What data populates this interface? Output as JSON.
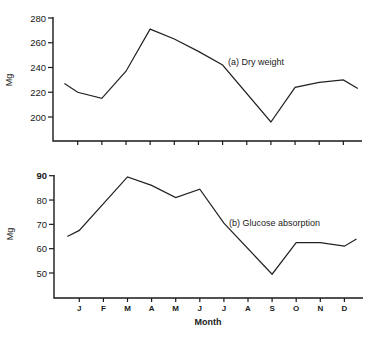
{
  "figure": {
    "background": "#ffffff",
    "ink_color": "#1a1a1a",
    "x_axis_title": "Month"
  },
  "chart_data": [
    {
      "type": "line",
      "title": "(a) Dry weight",
      "xlabel": "",
      "ylabel": "Mg",
      "ylim": [
        180,
        280
      ],
      "yticks": [
        200,
        220,
        240,
        260,
        280
      ],
      "grid": false,
      "categories": [
        "start",
        "J",
        "F",
        "M",
        "A",
        "M",
        "J",
        "J",
        "A",
        "S",
        "O",
        "N",
        "D",
        "end"
      ],
      "tick_labels_visible": false,
      "series": [
        {
          "name": "Dry weight",
          "x_index": [
            -0.55,
            0,
            1,
            2,
            3,
            4,
            5,
            6,
            8,
            9,
            10,
            11,
            11.6
          ],
          "values": [
            227,
            220,
            215,
            237,
            271,
            263,
            253,
            242,
            196,
            224,
            228,
            230,
            223
          ]
        }
      ],
      "annotations": [
        {
          "text": "(a) Dry weight",
          "near": "J-J decline"
        }
      ]
    },
    {
      "type": "line",
      "title": "(b) Glucose absorption",
      "xlabel": "Month",
      "ylabel": "Mg",
      "ylim": [
        40,
        90
      ],
      "yticks": [
        50,
        60,
        70,
        80,
        90
      ],
      "grid": false,
      "categories": [
        "J",
        "F",
        "M",
        "A",
        "M",
        "J",
        "J",
        "A",
        "S",
        "O",
        "N",
        "D"
      ],
      "series": [
        {
          "name": "Glucose absorption",
          "x_index": [
            -0.5,
            0,
            2,
            3,
            4,
            5,
            6,
            8,
            9,
            10,
            11,
            11.5
          ],
          "values": [
            65,
            67.5,
            89.5,
            86,
            81,
            84.5,
            70.5,
            49.5,
            62.5,
            62.5,
            61,
            64
          ]
        }
      ],
      "annotations": [
        {
          "text": "(b) Glucose absorption",
          "near": "J-A decline"
        }
      ]
    }
  ],
  "panels": [
    {
      "id": "a",
      "label": "(a) Dry weight",
      "ylabel": "Mg",
      "yticks": [
        "200",
        "220",
        "240",
        "260",
        "280"
      ]
    },
    {
      "id": "b",
      "label": "(b) Glucose absorption",
      "ylabel": "Mg",
      "yticks": [
        "50",
        "60",
        "70",
        "80",
        "90"
      ],
      "months": [
        "J",
        "F",
        "M",
        "A",
        "M",
        "J",
        "J",
        "A",
        "S",
        "O",
        "N",
        "D"
      ]
    }
  ]
}
